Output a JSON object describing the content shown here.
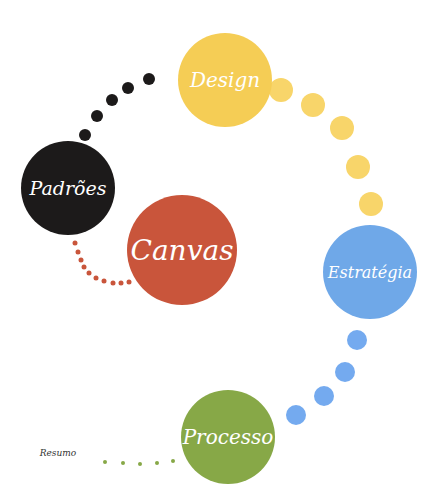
{
  "diagram": {
    "nodes": [
      {
        "id": "design",
        "label": "Design",
        "color": "#f5cd55",
        "cx": 225,
        "cy": 80,
        "r": 47,
        "font_size": 20
      },
      {
        "id": "padroes",
        "label": "Padrões",
        "color": "#1c1a1a",
        "cx": 68,
        "cy": 188,
        "r": 47,
        "font_size": 19
      },
      {
        "id": "canvas",
        "label": "Canvas",
        "color": "#c9553b",
        "cx": 182,
        "cy": 250,
        "r": 55,
        "font_size": 28
      },
      {
        "id": "estrategia",
        "label": "Estratégia",
        "color": "#6fa8e8",
        "cx": 370,
        "cy": 272,
        "r": 47,
        "font_size": 16
      },
      {
        "id": "processo",
        "label": "Processo",
        "color": "#87a847",
        "cx": 228,
        "cy": 437,
        "r": 47,
        "font_size": 20
      }
    ],
    "resumo_label": "Resumo",
    "connectors": [
      {
        "from": "padroes",
        "to": "design",
        "color": "#1c1a1a",
        "r": 6,
        "points": [
          [
            85,
            135
          ],
          [
            97,
            116
          ],
          [
            112,
            100
          ],
          [
            128,
            88
          ],
          [
            149,
            79
          ]
        ]
      },
      {
        "from": "design",
        "to": "estrategia",
        "color": "#f8d56a",
        "r": 12,
        "points": [
          [
            281,
            90
          ],
          [
            313,
            105
          ],
          [
            342,
            128
          ],
          [
            358,
            167
          ],
          [
            371,
            204
          ]
        ]
      },
      {
        "from": "estrategia",
        "to": "processo",
        "color": "#74aaef",
        "r": 10,
        "points": [
          [
            357,
            340
          ],
          [
            345,
            372
          ],
          [
            324,
            396
          ],
          [
            296,
            415
          ]
        ]
      },
      {
        "from": "padroes",
        "to": "canvas",
        "color": "#c9553b",
        "r": 2.5,
        "points": [
          [
            75,
            243
          ],
          [
            78,
            252
          ],
          [
            81,
            260
          ],
          [
            84,
            267
          ],
          [
            89,
            273
          ],
          [
            96,
            278
          ],
          [
            104,
            281
          ],
          [
            113,
            283
          ],
          [
            121,
            283
          ],
          [
            129,
            282
          ]
        ]
      },
      {
        "from": "resumo",
        "to": "processo",
        "color": "#87a847",
        "r": 2,
        "points": [
          [
            105,
            462
          ],
          [
            123,
            463
          ],
          [
            140,
            464
          ],
          [
            157,
            463
          ],
          [
            173,
            461
          ]
        ]
      }
    ]
  }
}
